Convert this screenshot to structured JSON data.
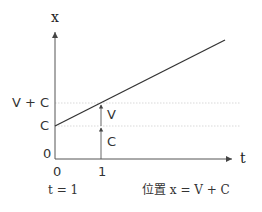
{
  "diagram": {
    "axes": {
      "y_label": "x",
      "x_label": "t"
    },
    "y_ticks": {
      "v_plus_c": "V + C",
      "c": "C",
      "zero": "0"
    },
    "x_ticks": {
      "zero": "0",
      "one": "1"
    },
    "segment_labels": {
      "v": "V",
      "c": "C"
    },
    "captions": {
      "left": "t = 1",
      "right": "位置 x = V + C"
    },
    "colors": {
      "line": "#333333",
      "axis": "#555555",
      "guide": "#c8c8c8"
    }
  }
}
